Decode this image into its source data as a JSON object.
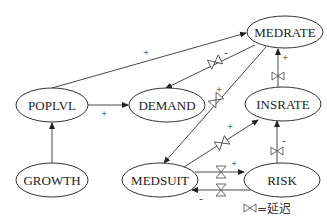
{
  "diagram": {
    "type": "causal-loop",
    "nodes": [
      {
        "id": "MEDRATE",
        "label": "MEDRATE",
        "cx": 285,
        "cy": 32,
        "rx": 38,
        "ry": 16
      },
      {
        "id": "POPLVL",
        "label": "POPLVL",
        "cx": 52,
        "cy": 105,
        "rx": 36,
        "ry": 17
      },
      {
        "id": "DEMAND",
        "label": "DEMAND",
        "cx": 167,
        "cy": 105,
        "rx": 38,
        "ry": 17
      },
      {
        "id": "INSRATE",
        "label": "INSRATE",
        "cx": 283,
        "cy": 104,
        "rx": 38,
        "ry": 17
      },
      {
        "id": "GROWTH",
        "label": "GROWTH",
        "cx": 52,
        "cy": 180,
        "rx": 36,
        "ry": 17
      },
      {
        "id": "MEDSUIT",
        "label": "MEDSUIT",
        "cx": 160,
        "cy": 180,
        "rx": 38,
        "ry": 17
      },
      {
        "id": "RISK",
        "label": "RISK",
        "cx": 282,
        "cy": 180,
        "rx": 38,
        "ry": 17
      }
    ],
    "edges": [
      {
        "from": "POPLVL",
        "to": "MEDRATE",
        "sign": "+",
        "delay": false
      },
      {
        "from": "POPLVL",
        "to": "DEMAND",
        "sign": "+",
        "delay": false
      },
      {
        "from": "GROWTH",
        "to": "POPLVL",
        "sign": "",
        "delay": false
      },
      {
        "from": "MEDRATE",
        "to": "DEMAND",
        "sign": "-",
        "delay": true
      },
      {
        "from": "MEDRATE",
        "to": "MEDSUIT",
        "sign": "+",
        "delay": true
      },
      {
        "from": "INSRATE",
        "to": "MEDRATE",
        "sign": "+",
        "delay": true
      },
      {
        "from": "MEDSUIT",
        "to": "INSRATE",
        "sign": "+",
        "delay": true
      },
      {
        "from": "MEDSUIT",
        "to": "RISK",
        "sign": "+",
        "delay": true
      },
      {
        "from": "RISK",
        "to": "MEDSUIT",
        "sign": "-",
        "delay": true
      },
      {
        "from": "RISK",
        "to": "INSRATE",
        "sign": "-",
        "delay": true
      }
    ],
    "signs": {
      "popl_medrate": "+",
      "popl_demand": "+",
      "medrate_demand": "-",
      "medrate_medsuit": "+",
      "insrate_medrate": "+",
      "medsuit_insrate": "+",
      "medsuit_risk": "+",
      "risk_medsuit": "-",
      "risk_insrate": "-"
    },
    "legend": {
      "symbol": "⋈",
      "text": "=延迟"
    }
  }
}
